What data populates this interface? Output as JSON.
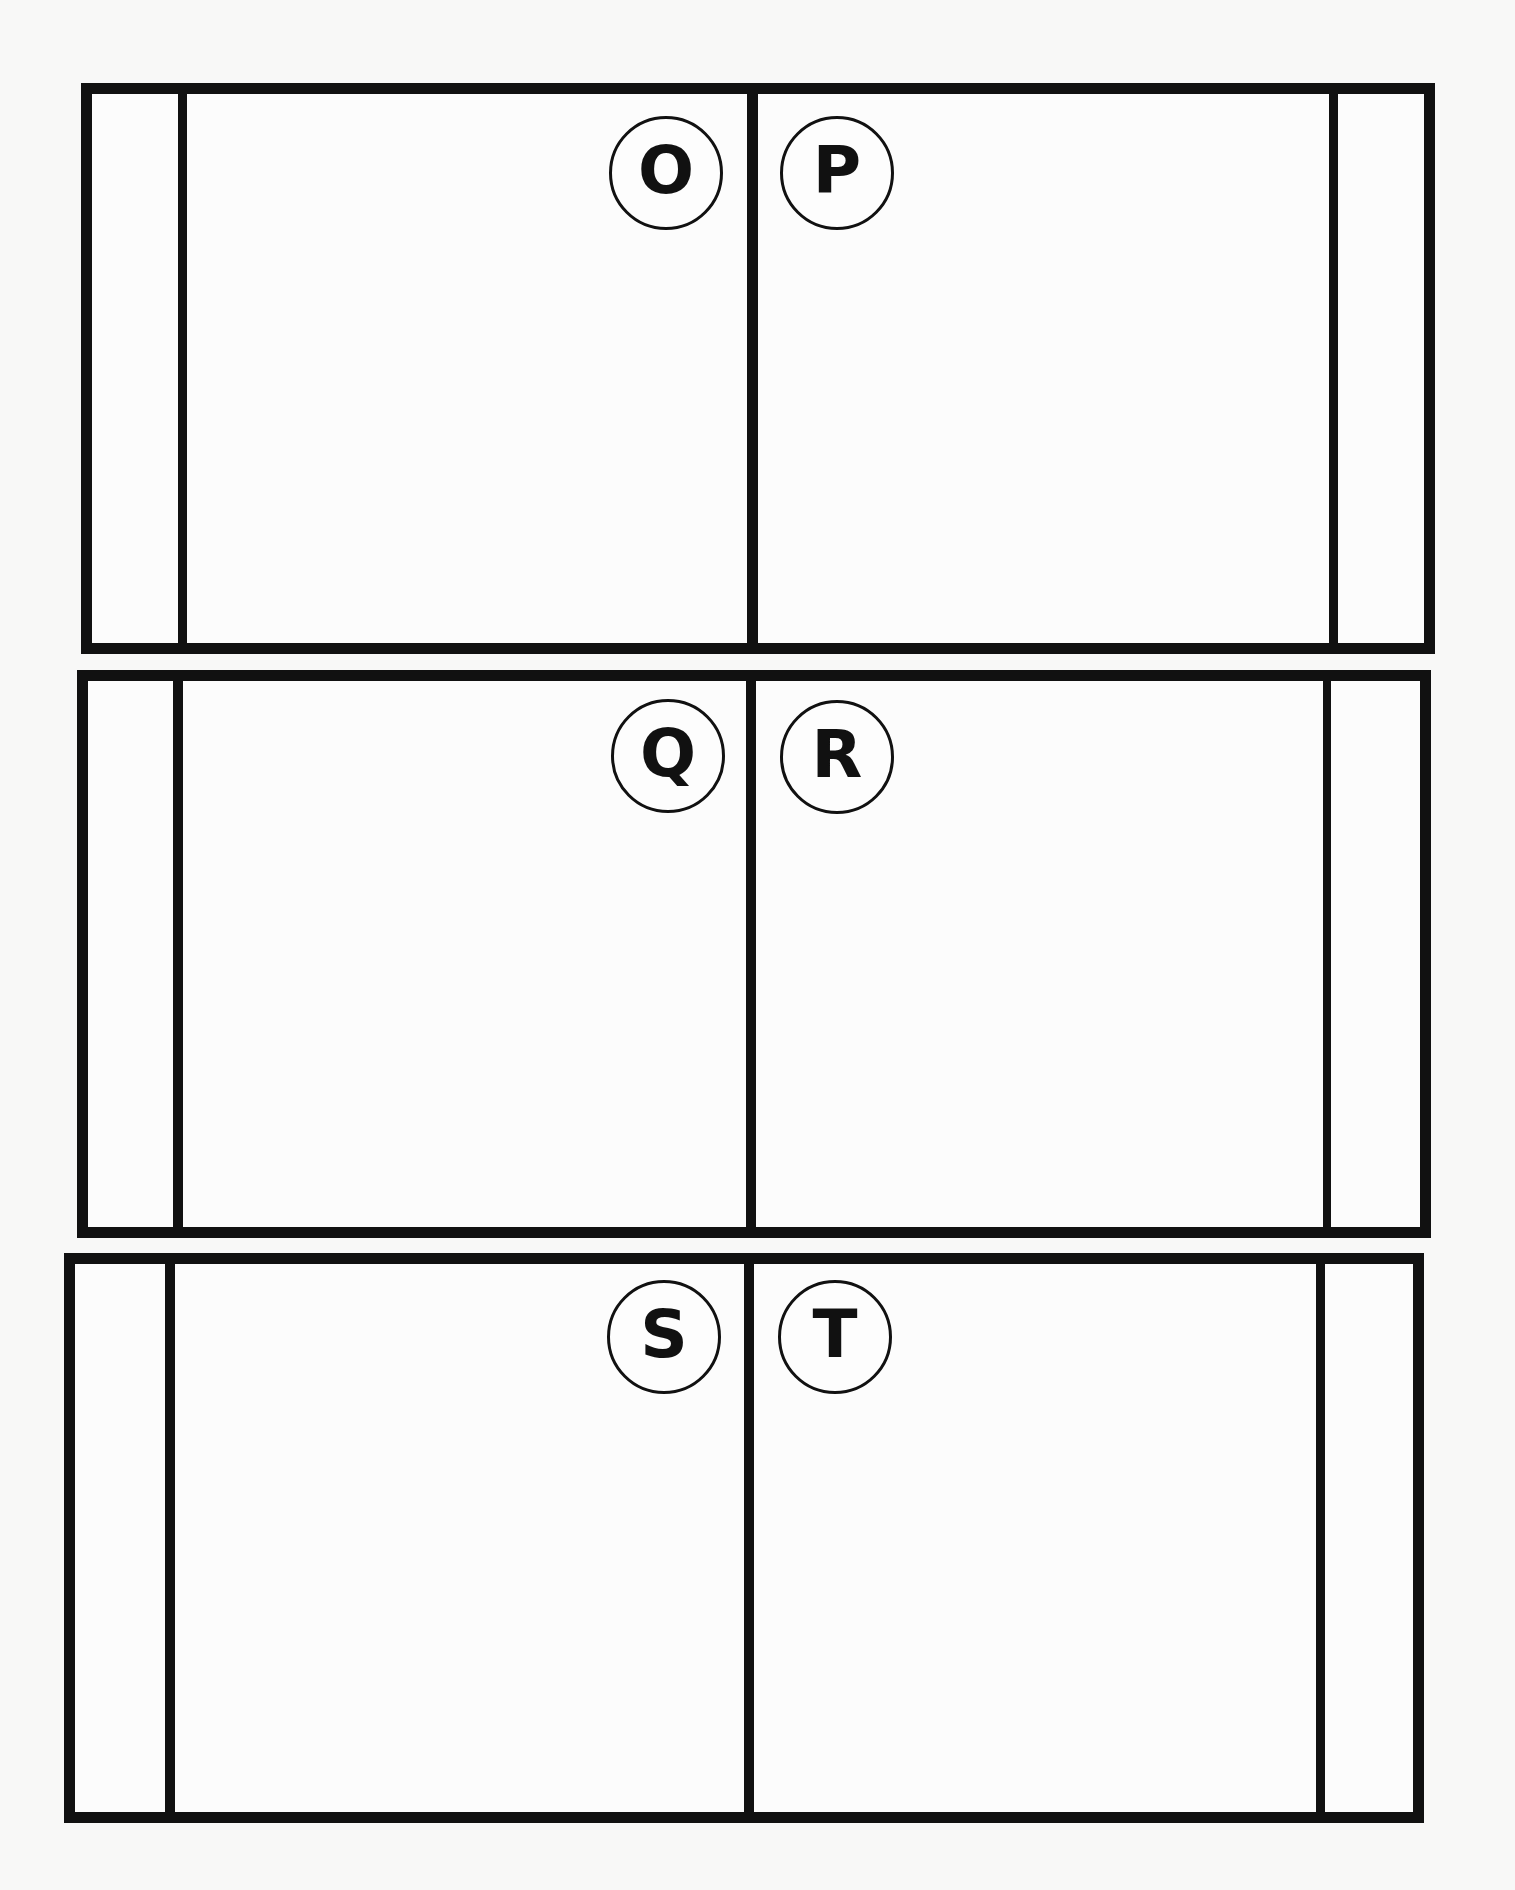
{
  "worksheet": {
    "frames": [
      {
        "id": "frame-1",
        "left_panel_label": "O",
        "right_panel_label": "P"
      },
      {
        "id": "frame-2",
        "left_panel_label": "Q",
        "right_panel_label": "R"
      },
      {
        "id": "frame-3",
        "left_panel_label": "S",
        "right_panel_label": "T"
      }
    ]
  },
  "colors": {
    "ink": "#111111",
    "paper": "#f8f8f7"
  }
}
